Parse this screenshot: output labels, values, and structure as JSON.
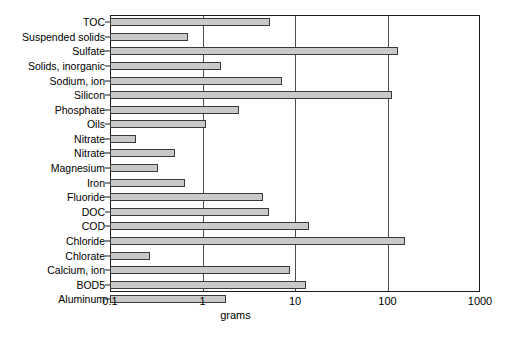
{
  "chart_data": {
    "type": "bar",
    "orientation": "horizontal",
    "title": "",
    "subtitle": "",
    "xlabel": "grams",
    "ylabel": "",
    "xscale": "log",
    "xlim": [
      0.1,
      1000
    ],
    "xticks": [
      0.1,
      1,
      10,
      100,
      1000
    ],
    "xticklabels": [
      "0.1",
      "1",
      "10",
      "100",
      "1000"
    ],
    "grid": true,
    "grid_axis": "x",
    "legend": false,
    "bar_color": "#c9c9c9",
    "bar_edge_color": "#3a3a3a",
    "categories": [
      "TOC",
      "Suspended solids",
      "Sulfate",
      "Solids, inorganic",
      "Sodium, ion",
      "Silicon",
      "Phosphate",
      "Oils",
      "Nitrate",
      "Nitrate",
      "Magnesium",
      "Iron",
      "Fluoride",
      "DOC",
      "COD",
      "Chloride",
      "Chlorate",
      "Calcium, ion",
      "BOD5",
      "Aluminum"
    ],
    "values": [
      5.4,
      0.7,
      130,
      1.6,
      7.3,
      112,
      2.5,
      1.1,
      0.19,
      0.5,
      0.33,
      0.65,
      4.5,
      5.2,
      14,
      155,
      0.27,
      8.8,
      13,
      1.8
    ]
  }
}
